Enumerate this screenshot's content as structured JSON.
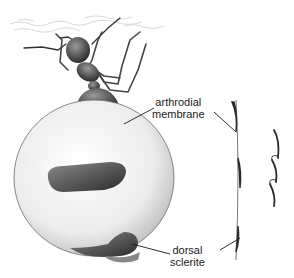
{
  "figure": {
    "labels": {
      "arthrodial": [
        "arthrodial",
        "membrane"
      ],
      "dorsal": [
        "dorsal",
        "sclerite"
      ]
    },
    "colors": {
      "ink": "#1a1a1a",
      "gaster_fill": "#ececec",
      "sclerite_dark": "#3a3a3a",
      "body_dark": "#2e2e2e",
      "ceiling_texture": "#cfcfcf"
    }
  }
}
